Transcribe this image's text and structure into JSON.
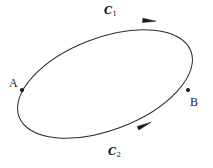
{
  "figure": {
    "type": "oriented-closed-curve-diagram",
    "background_color": "#ffffff",
    "stroke_color": "#2b2b2b",
    "text_color": "#1a1a1a",
    "width": 213,
    "height": 168
  },
  "points": [
    {
      "id": "A",
      "label": "A",
      "x": 22,
      "y": 90,
      "label_x": 9,
      "label_y": 77
    },
    {
      "id": "B",
      "label": "B",
      "x": 188,
      "y": 90,
      "label_x": 190,
      "label_y": 96
    }
  ],
  "curves": [
    {
      "id": "C1",
      "letter": "C",
      "subscript": "1",
      "arc": "upper",
      "direction": "left-to-right",
      "label_x": 104,
      "label_y": 5,
      "arrow_x": 152,
      "arrow_y": 21
    },
    {
      "id": "C2",
      "letter": "C",
      "subscript": "2",
      "arc": "lower",
      "direction": "left-to-right",
      "label_x": 108,
      "label_y": 146,
      "arrow_x": 146,
      "arrow_y": 126
    }
  ],
  "ellipse": {
    "center_x": 105,
    "center_y": 84,
    "radius_x": 92,
    "radius_y": 46,
    "rotation_deg": -21,
    "stroke_width": 1.0
  }
}
